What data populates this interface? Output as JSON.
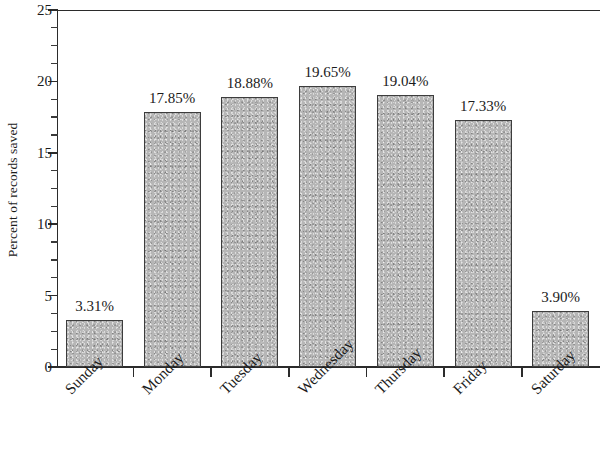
{
  "chart_data": {
    "type": "bar",
    "title": "",
    "subtitle": "",
    "xlabel": "",
    "ylabel": "Percent of records saved",
    "categories": [
      "Sunday",
      "Monday",
      "Tuesday",
      "Wednesday",
      "Thursday",
      "Friday",
      "Saturday"
    ],
    "values": [
      3.31,
      17.85,
      18.88,
      19.65,
      19.04,
      17.33,
      3.9
    ],
    "value_labels": [
      "3.31%",
      "17.85%",
      "18.88%",
      "19.65%",
      "19.04%",
      "17.33%",
      "3.90%"
    ],
    "ylim": [
      0,
      25
    ],
    "y_ticks": [
      0,
      5,
      10,
      15,
      20,
      25
    ],
    "y_tick_labels": [
      "0",
      "5",
      "10",
      "15",
      "20",
      "25"
    ],
    "y_minor_tick_step": 1.25,
    "grid": false,
    "legend": null,
    "bar_color": "#b6b6b6",
    "bar_edge_color": "#3d3d3d",
    "axis_color": "#2b2b2b",
    "background_color": "#ffffff",
    "x_label_rotation_degrees": -45
  }
}
